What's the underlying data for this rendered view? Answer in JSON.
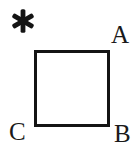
{
  "figure": {
    "type": "geometry-diagram",
    "background_color": "#ffffff",
    "stroke_color": "#141414",
    "text_color": "#1a1a1a",
    "shape": {
      "name": "square",
      "stroke_width_px": 3,
      "x_px": 34,
      "y_px": 50,
      "width_px": 76,
      "height_px": 77,
      "fill": "none"
    },
    "marker": {
      "icon": "asterisk-icon",
      "glyph": "*",
      "points": 6,
      "color": "#141414",
      "x_px": 13,
      "y_px": 17
    },
    "vertex_labels": [
      {
        "id": "a",
        "text": "A",
        "corner": "top-right",
        "x_px": 112,
        "y_px": 24
      },
      {
        "id": "b",
        "text": "B",
        "corner": "bottom-right",
        "x_px": 115,
        "y_px": 124
      },
      {
        "id": "c",
        "text": "C",
        "corner": "bottom-left",
        "x_px": 10,
        "y_px": 122
      }
    ]
  }
}
